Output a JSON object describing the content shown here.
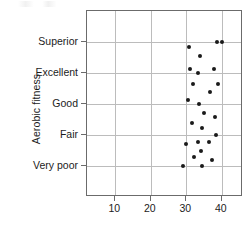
{
  "chart_data": {
    "type": "scatter",
    "title": "",
    "xlabel": "",
    "ylabel": "Aerobic fitness",
    "xlim": [
      2,
      46
    ],
    "ylim": [
      0,
      6
    ],
    "grid": true,
    "legend": false,
    "legend_position": "none",
    "xticks": [
      10,
      20,
      30,
      40
    ],
    "xtick_labels": [
      "10",
      "20",
      "30",
      "40"
    ],
    "ycategories": [
      "Very poor",
      "Fair",
      "Good",
      "Excellent",
      "Superior"
    ],
    "ytick_labels": [
      "Superior",
      "Excellent",
      "Good",
      "Fair",
      "Very poor"
    ],
    "marker": "filled-circle",
    "marker_color": "#1a1a1a",
    "marker_size": 4,
    "points": [
      {
        "x": 40.0,
        "y": "Superior"
      },
      {
        "x": 38.6,
        "y": "Superior"
      },
      {
        "x": 30.8,
        "y": 4.85
      },
      {
        "x": 33.8,
        "y": 4.55
      },
      {
        "x": 31.0,
        "y": 4.12
      },
      {
        "x": 37.9,
        "y": 4.12
      },
      {
        "x": 33.3,
        "y": "Excellent"
      },
      {
        "x": 31.9,
        "y": 3.65
      },
      {
        "x": 38.9,
        "y": 3.65
      },
      {
        "x": 36.8,
        "y": 3.38
      },
      {
        "x": 30.5,
        "y": 3.12
      },
      {
        "x": 33.6,
        "y": "Good"
      },
      {
        "x": 35.1,
        "y": 2.72
      },
      {
        "x": 38.1,
        "y": 2.58
      },
      {
        "x": 31.6,
        "y": 2.4
      },
      {
        "x": 34.4,
        "y": 2.22
      },
      {
        "x": 38.4,
        "y": "Fair"
      },
      {
        "x": 33.3,
        "y": 1.78
      },
      {
        "x": 36.3,
        "y": 1.78
      },
      {
        "x": 30.0,
        "y": 1.7
      },
      {
        "x": 34.2,
        "y": 1.48
      },
      {
        "x": 32.1,
        "y": 1.28
      },
      {
        "x": 37.2,
        "y": 1.2
      },
      {
        "x": 29.2,
        "y": "Very poor"
      },
      {
        "x": 34.3,
        "y": "Very poor"
      }
    ]
  },
  "axes": {
    "y_axis_title": "Aerobic fitness"
  }
}
